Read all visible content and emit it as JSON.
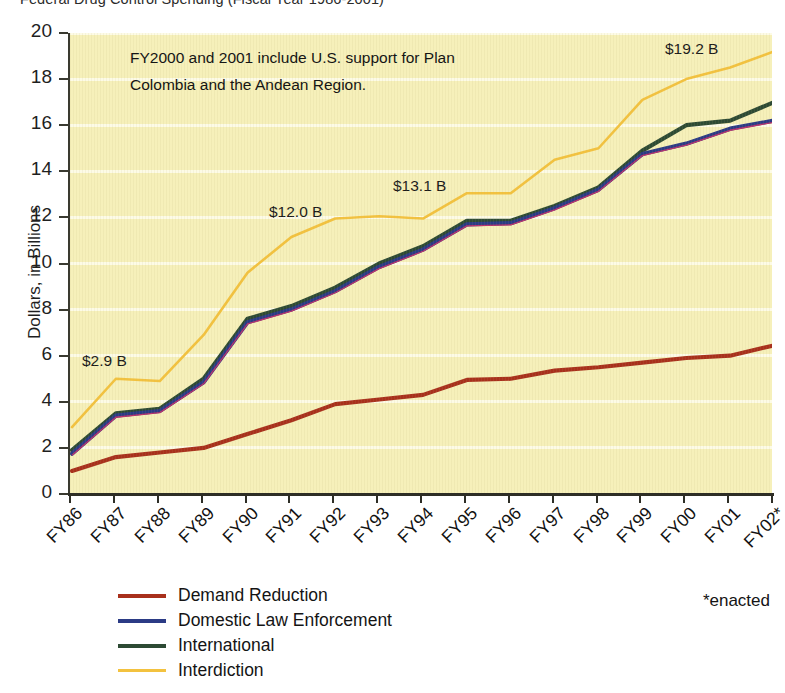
{
  "chart_data": {
    "type": "line",
    "title": "Federal Drug Control Spending (Fiscal Year 1986-2001)",
    "xlabel": "",
    "ylabel": "Dollars, in Billions",
    "ylim": [
      0,
      20
    ],
    "yticks": [
      0,
      2,
      4,
      6,
      8,
      10,
      12,
      14,
      16,
      18,
      20
    ],
    "grid": "horizontal-white",
    "legend_position": "bottom-left",
    "categories": [
      "FY86",
      "FY87",
      "FY88",
      "FY89",
      "FY90",
      "FY91",
      "FY92",
      "FY93",
      "FY94",
      "FY95",
      "FY96",
      "FY97",
      "FY98",
      "FY99",
      "FY00",
      "FY01",
      "FY02*"
    ],
    "series": [
      {
        "name": "Demand Reduction",
        "color": "#a8301c",
        "values": [
          1.0,
          1.6,
          1.8,
          2.0,
          2.6,
          3.2,
          3.9,
          4.1,
          4.3,
          4.95,
          5.0,
          5.35,
          5.5,
          5.7,
          5.9,
          6.0,
          6.45
        ]
      },
      {
        "name": "Domestic Law Enforcement",
        "color": "#2b3b85",
        "values": [
          1.75,
          3.4,
          3.6,
          4.85,
          7.45,
          8.0,
          8.8,
          9.85,
          10.6,
          11.7,
          11.75,
          12.4,
          13.2,
          14.75,
          15.2,
          15.85,
          16.2
        ]
      },
      {
        "name": "International",
        "color": "#2d4a34",
        "values": [
          1.9,
          3.5,
          3.7,
          5.0,
          7.6,
          8.15,
          8.95,
          10.0,
          10.75,
          11.85,
          11.85,
          12.5,
          13.3,
          14.9,
          16.0,
          16.2,
          17.0
        ]
      },
      {
        "name": "Interdiction",
        "color": "#f3c23f",
        "values": [
          2.9,
          5.0,
          4.9,
          6.9,
          9.6,
          11.15,
          11.95,
          12.05,
          11.95,
          13.05,
          13.05,
          14.5,
          15.0,
          17.1,
          18.0,
          18.5,
          19.2
        ]
      }
    ],
    "annotations": [
      {
        "text": "$2.9 B",
        "x": 80,
        "y": 352
      },
      {
        "text": "$12.0 B",
        "x": 267,
        "y": 203
      },
      {
        "text": "$13.1 B",
        "x": 391,
        "y": 177
      },
      {
        "text": "$19.2 B",
        "x": 663,
        "y": 40
      }
    ],
    "callout": {
      "line1": "FY2000 and 2001 include U.S. support for  Plan",
      "line2": "Colombia and the Andean Region."
    },
    "footnote": "*enacted",
    "colors": {
      "plot_background": "#f6f0ba",
      "gridline": "#fdfbe8",
      "axis": "#2e2e26",
      "page_background": "#ffffff"
    }
  }
}
